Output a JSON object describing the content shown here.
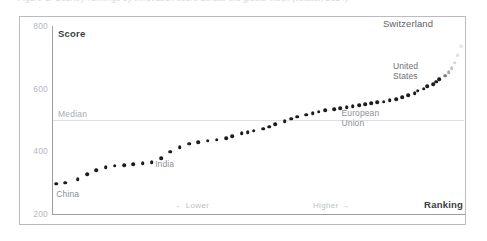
{
  "figure": {
    "caption_top": "Figure 1: Country rankings by innovation score across the global index (scatter, 2024)",
    "frame_border_color": "#b9bcc2",
    "background": "#ffffff"
  },
  "axes": {
    "y_title": "Score",
    "x_title": "Ranking",
    "y_ticks": [
      800,
      600,
      400,
      200
    ],
    "y_min": 200,
    "y_max": 800,
    "x_direction_left": "← Lower",
    "x_direction_right": "Higher →",
    "tick_color": "#b6b9bf",
    "axis_color": "#9aa0a6"
  },
  "reference": {
    "median_label": "Median",
    "median_value": 500,
    "median_line_color": "#dcdee2"
  },
  "annotations": {
    "china": "China",
    "india": "India",
    "european_union_line1": "European",
    "european_union_line2": "Union",
    "united_states_line1": "United",
    "united_states_line2": "States",
    "switzerland": "Switzerland"
  },
  "chart_data": {
    "type": "scatter",
    "title": "",
    "xlabel": "Ranking",
    "ylabel": "Score",
    "xlim": [
      0,
      133
    ],
    "ylim": [
      200,
      800
    ],
    "grid": false,
    "legend": null,
    "point_color": "#1c1c1c",
    "point_size": 3.6,
    "median": 500,
    "series": [
      {
        "name": "Innovation score by rank",
        "points": [
          {
            "rank": 1,
            "score": 297
          },
          {
            "rank": 4,
            "score": 300
          },
          {
            "rank": 8,
            "score": 311
          },
          {
            "rank": 11,
            "score": 327
          },
          {
            "rank": 14,
            "score": 340
          },
          {
            "rank": 17,
            "score": 349
          },
          {
            "rank": 20,
            "score": 354
          },
          {
            "rank": 23,
            "score": 356
          },
          {
            "rank": 26,
            "score": 358
          },
          {
            "rank": 29,
            "score": 362
          },
          {
            "rank": 32,
            "score": 366
          },
          {
            "rank": 35,
            "score": 378
          },
          {
            "rank": 38,
            "score": 399
          },
          {
            "rank": 41,
            "score": 413
          },
          {
            "rank": 44,
            "score": 425
          },
          {
            "rank": 47,
            "score": 430
          },
          {
            "rank": 50,
            "score": 434
          },
          {
            "rank": 53,
            "score": 437
          },
          {
            "rank": 56,
            "score": 441
          },
          {
            "rank": 58,
            "score": 449
          },
          {
            "rank": 61,
            "score": 457
          },
          {
            "rank": 63,
            "score": 462
          },
          {
            "rank": 65,
            "score": 466
          },
          {
            "rank": 68,
            "score": 472
          },
          {
            "rank": 70,
            "score": 479
          },
          {
            "rank": 72,
            "score": 487
          },
          {
            "rank": 75,
            "score": 496
          },
          {
            "rank": 77,
            "score": 504
          },
          {
            "rank": 79,
            "score": 510
          },
          {
            "rank": 82,
            "score": 517
          },
          {
            "rank": 84,
            "score": 522
          },
          {
            "rank": 86,
            "score": 527
          },
          {
            "rank": 88,
            "score": 531
          },
          {
            "rank": 91,
            "score": 534
          },
          {
            "rank": 93,
            "score": 538
          },
          {
            "rank": 95,
            "score": 541
          },
          {
            "rank": 97,
            "score": 544
          },
          {
            "rank": 99,
            "score": 547
          },
          {
            "rank": 101,
            "score": 550
          },
          {
            "rank": 103,
            "score": 553
          },
          {
            "rank": 105,
            "score": 556
          },
          {
            "rank": 107,
            "score": 559
          },
          {
            "rank": 109,
            "score": 563
          },
          {
            "rank": 111,
            "score": 567
          },
          {
            "rank": 113,
            "score": 573
          },
          {
            "rank": 115,
            "score": 580
          },
          {
            "rank": 117,
            "score": 586
          },
          {
            "rank": 118,
            "score": 593
          },
          {
            "rank": 120,
            "score": 600
          },
          {
            "rank": 121,
            "score": 608
          },
          {
            "rank": 123,
            "score": 614
          },
          {
            "rank": 124,
            "score": 622
          },
          {
            "rank": 125,
            "score": 631
          },
          {
            "rank": 127,
            "score": 641
          },
          {
            "rank": 128,
            "score": 652
          },
          {
            "rank": 129,
            "score": 666
          },
          {
            "rank": 130,
            "score": 683
          },
          {
            "rank": 131,
            "score": 706
          },
          {
            "rank": 132,
            "score": 736
          }
        ]
      }
    ],
    "labeled_points": [
      {
        "label": "China",
        "rank": 4,
        "score": 300
      },
      {
        "label": "India",
        "rank": 35,
        "score": 378
      },
      {
        "label": "European Union",
        "rank": 95,
        "score": 541
      },
      {
        "label": "United States",
        "rank": 121,
        "score": 608
      },
      {
        "label": "Switzerland",
        "rank": 132,
        "score": 736
      }
    ]
  }
}
